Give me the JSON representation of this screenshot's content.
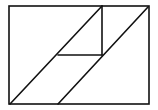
{
  "diagram": {
    "width": 158,
    "height": 110,
    "stroke_color": "#111111",
    "background": "#ffffff",
    "stroke_width": 1.6,
    "outer_rect": {
      "x1": 9,
      "y1": 6,
      "x2": 149,
      "y2": 104
    },
    "lines": [
      {
        "id": "diagonal-left",
        "x1": 10,
        "y1": 104,
        "x2": 102,
        "y2": 6
      },
      {
        "id": "vertical-inner",
        "x1": 102,
        "y1": 6,
        "x2": 102,
        "y2": 55
      },
      {
        "id": "horizontal-inner",
        "x1": 58,
        "y1": 55,
        "x2": 102,
        "y2": 55
      },
      {
        "id": "diagonal-right",
        "x1": 58,
        "y1": 104,
        "x2": 148,
        "y2": 7
      }
    ]
  }
}
